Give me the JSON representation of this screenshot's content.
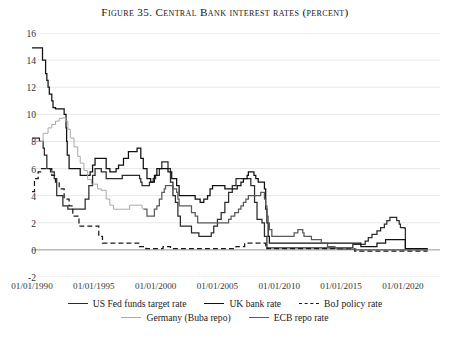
{
  "title": "Figure 35. Central Bank interest rates (percent)",
  "legend": {
    "rows": [
      [
        {
          "label": "US Fed funds target rate",
          "key": "us"
        },
        {
          "label": "UK bank rate",
          "key": "uk"
        },
        {
          "label": "BoJ policy rate",
          "key": "boj"
        }
      ],
      [
        {
          "label": "Germany (Buba repo)",
          "key": "de"
        },
        {
          "label": "ECB repo rate",
          "key": "ecb"
        }
      ]
    ]
  },
  "chart_data": {
    "type": "line",
    "title": "Figure 35. Central Bank interest rates (percent)",
    "xlabel": "",
    "ylabel": "",
    "ylim": [
      -2,
      16
    ],
    "yticks": [
      -2,
      0,
      2,
      4,
      6,
      8,
      10,
      12,
      14,
      16
    ],
    "xlim": [
      "1990-01-01",
      "2023-01-01"
    ],
    "xticks": [
      "01/01/1990",
      "01/01/1995",
      "01/01/2000",
      "01/01/2005",
      "01/01/2010",
      "01/01/2015",
      "01/01/2020"
    ],
    "grid": "horizontal",
    "legend_position": "below",
    "step": true,
    "colors": {
      "us": "#2b2b2b",
      "uk": "#111111",
      "boj": "#1a1a1a",
      "de": "#a9a9a9",
      "ecb": "#5a5a5a"
    },
    "styles": {
      "us": "solid",
      "uk": "solid",
      "boj": "dashed",
      "de": "solid",
      "ecb": "solid"
    },
    "series": [
      {
        "name": "US Fed funds target rate",
        "key": "us",
        "points": [
          [
            1990.0,
            8.25
          ],
          [
            1990.6,
            8.0
          ],
          [
            1990.9,
            7.5
          ],
          [
            1991.0,
            7.0
          ],
          [
            1991.2,
            6.0
          ],
          [
            1991.5,
            5.75
          ],
          [
            1991.8,
            5.25
          ],
          [
            1992.0,
            4.0
          ],
          [
            1992.5,
            3.25
          ],
          [
            1992.9,
            3.0
          ],
          [
            1993.5,
            3.0
          ],
          [
            1994.0,
            3.0
          ],
          [
            1994.3,
            3.75
          ],
          [
            1994.6,
            4.75
          ],
          [
            1994.9,
            5.5
          ],
          [
            1995.1,
            6.0
          ],
          [
            1995.6,
            5.75
          ],
          [
            1996.0,
            5.25
          ],
          [
            1996.5,
            5.25
          ],
          [
            1997.3,
            5.5
          ],
          [
            1998.7,
            5.25
          ],
          [
            1998.8,
            5.0
          ],
          [
            1998.9,
            4.75
          ],
          [
            1999.5,
            5.0
          ],
          [
            1999.8,
            5.25
          ],
          [
            2000.0,
            5.5
          ],
          [
            2000.3,
            6.0
          ],
          [
            2000.5,
            6.5
          ],
          [
            2001.0,
            6.0
          ],
          [
            2001.2,
            5.0
          ],
          [
            2001.4,
            4.0
          ],
          [
            2001.6,
            3.5
          ],
          [
            2001.8,
            2.5
          ],
          [
            2002.0,
            1.75
          ],
          [
            2002.9,
            1.25
          ],
          [
            2003.5,
            1.0
          ],
          [
            2004.5,
            1.25
          ],
          [
            2004.7,
            1.75
          ],
          [
            2005.0,
            2.25
          ],
          [
            2005.3,
            2.75
          ],
          [
            2005.6,
            3.5
          ],
          [
            2005.9,
            4.25
          ],
          [
            2006.2,
            4.75
          ],
          [
            2006.5,
            5.25
          ],
          [
            2007.5,
            5.25
          ],
          [
            2007.7,
            4.75
          ],
          [
            2008.0,
            3.5
          ],
          [
            2008.2,
            2.25
          ],
          [
            2008.6,
            2.0
          ],
          [
            2008.8,
            1.0
          ],
          [
            2009.0,
            0.15
          ],
          [
            2012.0,
            0.15
          ],
          [
            2015.95,
            0.4
          ],
          [
            2016.95,
            0.65
          ],
          [
            2017.2,
            0.9
          ],
          [
            2017.5,
            1.15
          ],
          [
            2017.9,
            1.4
          ],
          [
            2018.2,
            1.65
          ],
          [
            2018.5,
            1.9
          ],
          [
            2018.7,
            2.15
          ],
          [
            2018.95,
            2.4
          ],
          [
            2019.5,
            2.15
          ],
          [
            2019.7,
            1.9
          ],
          [
            2019.8,
            1.65
          ],
          [
            2020.1,
            1.6
          ],
          [
            2020.2,
            0.1
          ],
          [
            2022.0,
            0.1
          ]
        ]
      },
      {
        "name": "UK bank rate",
        "key": "uk",
        "points": [
          [
            1990.0,
            14.9
          ],
          [
            1990.8,
            14.9
          ],
          [
            1990.85,
            14.0
          ],
          [
            1991.1,
            13.0
          ],
          [
            1991.2,
            12.5
          ],
          [
            1991.3,
            12.0
          ],
          [
            1991.4,
            11.5
          ],
          [
            1991.6,
            11.0
          ],
          [
            1991.7,
            10.5
          ],
          [
            1991.9,
            10.4
          ],
          [
            1992.6,
            10.0
          ],
          [
            1992.75,
            9.0
          ],
          [
            1992.8,
            8.0
          ],
          [
            1992.85,
            7.0
          ],
          [
            1993.0,
            6.0
          ],
          [
            1993.9,
            5.5
          ],
          [
            1994.7,
            5.75
          ],
          [
            1994.9,
            6.25
          ],
          [
            1995.1,
            6.75
          ],
          [
            1996.0,
            6.0
          ],
          [
            1996.3,
            5.75
          ],
          [
            1996.8,
            6.0
          ],
          [
            1997.0,
            6.25
          ],
          [
            1997.4,
            6.75
          ],
          [
            1997.8,
            7.25
          ],
          [
            1998.5,
            7.5
          ],
          [
            1998.8,
            6.75
          ],
          [
            1999.0,
            6.0
          ],
          [
            1999.3,
            5.25
          ],
          [
            1999.6,
            5.0
          ],
          [
            1999.9,
            5.5
          ],
          [
            2000.1,
            6.0
          ],
          [
            2001.0,
            5.75
          ],
          [
            2001.3,
            5.25
          ],
          [
            2001.7,
            4.75
          ],
          [
            2001.9,
            4.0
          ],
          [
            2002.0,
            4.0
          ],
          [
            2003.2,
            3.75
          ],
          [
            2003.6,
            3.5
          ],
          [
            2003.9,
            3.75
          ],
          [
            2004.2,
            4.0
          ],
          [
            2004.4,
            4.5
          ],
          [
            2004.6,
            4.75
          ],
          [
            2005.6,
            4.5
          ],
          [
            2006.6,
            4.75
          ],
          [
            2006.9,
            5.0
          ],
          [
            2007.1,
            5.25
          ],
          [
            2007.4,
            5.5
          ],
          [
            2007.5,
            5.75
          ],
          [
            2007.95,
            5.5
          ],
          [
            2008.1,
            5.25
          ],
          [
            2008.3,
            5.0
          ],
          [
            2008.8,
            4.5
          ],
          [
            2008.9,
            3.0
          ],
          [
            2009.0,
            2.0
          ],
          [
            2009.1,
            1.0
          ],
          [
            2009.2,
            0.5
          ],
          [
            2016.6,
            0.25
          ],
          [
            2017.9,
            0.5
          ],
          [
            2018.6,
            0.75
          ],
          [
            2020.2,
            0.1
          ],
          [
            2022.0,
            0.1
          ]
        ]
      },
      {
        "name": "BoJ policy rate",
        "key": "boj",
        "points": [
          [
            1990.0,
            4.3
          ],
          [
            1990.2,
            5.25
          ],
          [
            1990.5,
            5.75
          ],
          [
            1990.7,
            6.0
          ],
          [
            1991.5,
            6.0
          ],
          [
            1991.6,
            5.5
          ],
          [
            1991.9,
            5.0
          ],
          [
            1992.2,
            4.5
          ],
          [
            1992.6,
            3.75
          ],
          [
            1993.0,
            3.25
          ],
          [
            1993.3,
            2.5
          ],
          [
            1993.8,
            1.75
          ],
          [
            1995.3,
            1.75
          ],
          [
            1995.4,
            1.0
          ],
          [
            1995.7,
            0.5
          ],
          [
            1998.7,
            0.25
          ],
          [
            1999.2,
            0.1
          ],
          [
            2000.6,
            0.25
          ],
          [
            2001.2,
            0.1
          ],
          [
            2006.5,
            0.25
          ],
          [
            2007.2,
            0.5
          ],
          [
            2008.9,
            0.3
          ],
          [
            2009.0,
            0.1
          ],
          [
            2016.1,
            -0.1
          ],
          [
            2022.0,
            -0.1
          ]
        ]
      },
      {
        "name": "Germany (Buba repo)",
        "key": "de",
        "points": [
          [
            1990.0,
            8.0
          ],
          [
            1990.5,
            8.0
          ],
          [
            1990.9,
            8.6
          ],
          [
            1991.3,
            9.0
          ],
          [
            1991.6,
            9.25
          ],
          [
            1991.9,
            9.5
          ],
          [
            1992.2,
            9.7
          ],
          [
            1992.5,
            9.75
          ],
          [
            1992.7,
            9.5
          ],
          [
            1992.9,
            8.9
          ],
          [
            1993.1,
            8.25
          ],
          [
            1993.4,
            7.6
          ],
          [
            1993.7,
            6.9
          ],
          [
            1993.9,
            6.4
          ],
          [
            1994.2,
            5.85
          ],
          [
            1994.5,
            5.2
          ],
          [
            1994.8,
            4.85
          ],
          [
            1995.3,
            4.5
          ],
          [
            1995.6,
            4.4
          ],
          [
            1996.0,
            3.75
          ],
          [
            1996.3,
            3.3
          ],
          [
            1996.6,
            3.0
          ],
          [
            1997.5,
            3.0
          ],
          [
            1997.9,
            3.3
          ],
          [
            1998.5,
            3.3
          ],
          [
            1998.9,
            3.0
          ]
        ]
      },
      {
        "name": "ECB repo rate",
        "key": "ecb",
        "points": [
          [
            1999.0,
            3.0
          ],
          [
            1999.3,
            2.5
          ],
          [
            1999.9,
            3.0
          ],
          [
            2000.1,
            3.25
          ],
          [
            2000.3,
            3.75
          ],
          [
            2000.5,
            4.25
          ],
          [
            2000.7,
            4.5
          ],
          [
            2000.8,
            4.75
          ],
          [
            2001.4,
            4.5
          ],
          [
            2001.7,
            4.25
          ],
          [
            2001.8,
            3.75
          ],
          [
            2001.9,
            3.25
          ],
          [
            2002.9,
            2.75
          ],
          [
            2003.2,
            2.5
          ],
          [
            2003.4,
            2.0
          ],
          [
            2005.9,
            2.25
          ],
          [
            2006.1,
            2.5
          ],
          [
            2006.4,
            2.75
          ],
          [
            2006.7,
            3.0
          ],
          [
            2006.9,
            3.25
          ],
          [
            2007.1,
            3.5
          ],
          [
            2007.3,
            3.75
          ],
          [
            2007.5,
            4.0
          ],
          [
            2008.5,
            4.25
          ],
          [
            2008.8,
            3.75
          ],
          [
            2008.9,
            3.25
          ],
          [
            2009.0,
            2.5
          ],
          [
            2009.1,
            2.0
          ],
          [
            2009.2,
            1.5
          ],
          [
            2009.4,
            1.0
          ],
          [
            2011.2,
            1.25
          ],
          [
            2011.5,
            1.5
          ],
          [
            2011.9,
            1.25
          ],
          [
            2012.0,
            1.0
          ],
          [
            2012.6,
            0.75
          ],
          [
            2013.4,
            0.5
          ],
          [
            2013.9,
            0.25
          ],
          [
            2014.5,
            0.15
          ],
          [
            2014.7,
            0.05
          ],
          [
            2016.2,
            0.0
          ],
          [
            2022.0,
            0.0
          ]
        ]
      }
    ]
  }
}
